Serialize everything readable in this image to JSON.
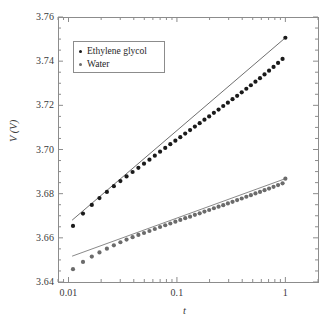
{
  "chart_data": {
    "type": "scatter",
    "title": "",
    "xlabel": "t",
    "ylabel": "V (V)",
    "xscale": "log",
    "yscale": "linear",
    "xlim": [
      0.008,
      2.0
    ],
    "ylim": [
      3.64,
      3.76
    ],
    "grid": false,
    "legend_position": "upper left",
    "x_ticks": [
      {
        "value": 0.01,
        "label": "0.01"
      },
      {
        "value": 0.1,
        "label": "0.1"
      },
      {
        "value": 1,
        "label": "1"
      }
    ],
    "y_ticks": [
      {
        "value": 3.64,
        "label": "3.64"
      },
      {
        "value": 3.66,
        "label": "3.66"
      },
      {
        "value": 3.68,
        "label": "3.68"
      },
      {
        "value": 3.7,
        "label": "3.70"
      },
      {
        "value": 3.72,
        "label": "3.72"
      },
      {
        "value": 3.74,
        "label": "3.74"
      },
      {
        "value": 3.76,
        "label": "3.76"
      }
    ],
    "series": [
      {
        "name": "Ethylene glycol",
        "color": "#1a1a1a",
        "marker": "circle",
        "fit_line_color": "#4a4a4a",
        "fit_line": {
          "x0": 0.0108,
          "y0": 3.668,
          "x1": 1.0,
          "y1": 3.7506
        },
        "x": [
          0.011,
          0.0136,
          0.0164,
          0.0193,
          0.0226,
          0.0262,
          0.0301,
          0.0343,
          0.039,
          0.0441,
          0.0497,
          0.0558,
          0.0625,
          0.0699,
          0.078,
          0.0869,
          0.0967,
          0.1074,
          0.1192,
          0.1322,
          0.1464,
          0.1621,
          0.1794,
          0.1983,
          0.2192,
          0.2421,
          0.2673,
          0.2951,
          0.3256,
          0.3591,
          0.3959,
          0.4364,
          0.4809,
          0.5298,
          0.5835,
          0.6425,
          0.7073,
          0.7784,
          0.8565,
          0.9423,
          1.0
        ],
        "y": [
          3.6654,
          3.671,
          3.6749,
          3.678,
          3.6808,
          3.6834,
          3.6857,
          3.6878,
          3.6898,
          3.6917,
          3.6936,
          3.6954,
          3.6972,
          3.699,
          3.7007,
          3.7024,
          3.704,
          3.7056,
          3.7072,
          3.7088,
          3.7104,
          3.7119,
          3.7135,
          3.715,
          3.7166,
          3.7181,
          3.7197,
          3.7212,
          3.7228,
          3.7243,
          3.7259,
          3.7275,
          3.7291,
          3.7307,
          3.7323,
          3.734,
          3.7357,
          3.7374,
          3.7392,
          3.741,
          3.7506
        ]
      },
      {
        "name": "Water",
        "color": "#6b6b6b",
        "marker": "circle",
        "fit_line_color": "#6b6b6b",
        "fit_line": {
          "x0": 0.0108,
          "y0": 3.6517,
          "x1": 1.0,
          "y1": 3.6868
        },
        "x": [
          0.011,
          0.0136,
          0.0164,
          0.0193,
          0.0226,
          0.0262,
          0.0301,
          0.0343,
          0.039,
          0.0441,
          0.0497,
          0.0558,
          0.0625,
          0.0699,
          0.078,
          0.0869,
          0.0967,
          0.1074,
          0.1192,
          0.1322,
          0.1464,
          0.1621,
          0.1794,
          0.1983,
          0.2192,
          0.2421,
          0.2673,
          0.2951,
          0.3256,
          0.3591,
          0.3959,
          0.4364,
          0.4809,
          0.5298,
          0.5835,
          0.6425,
          0.7073,
          0.7784,
          0.8565,
          0.9423,
          1.0
        ],
        "y": [
          3.6458,
          3.6491,
          3.6515,
          3.6534,
          3.6551,
          3.6566,
          3.658,
          3.6592,
          3.6603,
          3.6613,
          3.6622,
          3.6631,
          3.664,
          3.6649,
          3.6657,
          3.6665,
          3.6673,
          3.6681,
          3.6689,
          3.6696,
          3.6704,
          3.6711,
          3.6719,
          3.6726,
          3.6734,
          3.6741,
          3.6748,
          3.6756,
          3.6763,
          3.6771,
          3.6778,
          3.6786,
          3.6793,
          3.6801,
          3.6808,
          3.6816,
          3.6823,
          3.6831,
          3.6839,
          3.6847,
          3.6868
        ]
      }
    ]
  },
  "legend": {
    "entries": [
      {
        "label": "Ethylene glycol"
      },
      {
        "label": "Water"
      }
    ]
  },
  "axes": {
    "x_title": "t",
    "y_title": "V (V)"
  },
  "colors": {
    "axis": "#8c8c8c",
    "text": "#3a3a3a",
    "background": "#ffffff"
  }
}
